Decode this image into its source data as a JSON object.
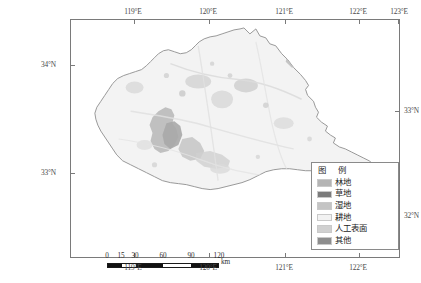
{
  "figure": {
    "type": "thematic-landcover-map",
    "frame": {
      "left": 70,
      "top": 19,
      "width": 330,
      "height": 239
    }
  },
  "axes": {
    "top_ticks": [
      {
        "label": "119°E",
        "x": 63
      },
      {
        "label": "120°E",
        "x": 138
      },
      {
        "label": "121°E",
        "x": 214
      },
      {
        "label": "122°E",
        "x": 288
      },
      {
        "label": "123°E",
        "x": 327
      }
    ],
    "bottom_ticks": [
      {
        "label": "119°E",
        "x": 63
      },
      {
        "label": "120°E",
        "x": 138
      },
      {
        "label": "121°E",
        "x": 214
      },
      {
        "label": "122°E",
        "x": 288
      }
    ],
    "left_ticks": [
      {
        "label": "34°N",
        "y": 45
      },
      {
        "label": "33°N",
        "y": 153
      }
    ],
    "right_ticks": [
      {
        "label": "33°N",
        "y": 91
      },
      {
        "label": "32°N",
        "y": 196
      }
    ]
  },
  "scalebar": {
    "unit": "km",
    "ticks": [
      "0",
      "15",
      "30",
      "60",
      "90",
      "120"
    ],
    "tick_positions": [
      0,
      14,
      28,
      56,
      84,
      112
    ],
    "segments": [
      {
        "from": 0,
        "to": 14,
        "fill": "#111111"
      },
      {
        "from": 14,
        "to": 28,
        "fill": "#ffffff"
      },
      {
        "from": 28,
        "to": 56,
        "fill": "#111111"
      },
      {
        "from": 56,
        "to": 84,
        "fill": "#ffffff"
      },
      {
        "from": 84,
        "to": 112,
        "fill": "#111111"
      }
    ]
  },
  "legend": {
    "title": "图 例",
    "items": [
      {
        "label": "林地",
        "color": "#b4b4b4"
      },
      {
        "label": "草地",
        "color": "#7b7b7b"
      },
      {
        "label": "湿地",
        "color": "#c4c4c4"
      },
      {
        "label": "耕地",
        "color": "#f2f2f2"
      },
      {
        "label": "人工表面",
        "color": "#d0d0d0"
      },
      {
        "label": "其他",
        "color": "#8d8d8d"
      }
    ]
  },
  "map": {
    "region_fill": "#f3f3f3",
    "border_color": "#8e8e8e",
    "background": "#ffffff",
    "patch_colors": {
      "wetland": "#c9c9c9",
      "builtup": "#dcdcdc",
      "grass": "#a9a9a9",
      "forest": "#bdbdbd"
    }
  }
}
